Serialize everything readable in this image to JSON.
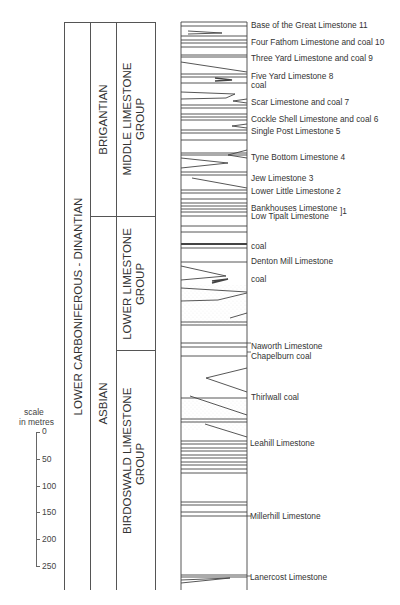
{
  "diagram": {
    "type": "stratigraphic-column",
    "columns": {
      "system": {
        "label": "LOWER CARBONIFEROUS - DINANTIAN"
      },
      "stages": [
        {
          "label": "BRIGANTIAN"
        },
        {
          "label": "ASBIAN"
        }
      ],
      "groups": [
        {
          "line1": "MIDDLE LIMESTONE",
          "line2": "GROUP"
        },
        {
          "line1": "LOWER LIMESTONE",
          "line2": "GROUP"
        },
        {
          "line1": "BIRDOSWALD LIMESTONE",
          "line2": "GROUP"
        }
      ]
    },
    "scale": {
      "title_line1": "scale",
      "title_line2": "in metres",
      "ticks": [
        "0",
        "50",
        "100",
        "150",
        "200",
        "250"
      ]
    },
    "units": [
      {
        "label": "Base of the Great Limestone  11",
        "y": 24
      },
      {
        "label": "Four Fathom Limestone and coal  10",
        "y": 38
      },
      {
        "label": "Three Yard Limestone and coal  9",
        "y": 54
      },
      {
        "label": "Five Yard Limestone  8",
        "y": 72
      },
      {
        "label": "coal",
        "y": 82
      },
      {
        "label": "Scar Limestone and coal  7",
        "y": 98
      },
      {
        "label": "Cockle Shell Limestone and coal  6",
        "y": 115
      },
      {
        "label": "Single Post Limestone  5",
        "y": 127
      },
      {
        "label": "Tyne Bottom Limestone  4",
        "y": 153
      },
      {
        "label": "Jew Limestone  3",
        "y": 174
      },
      {
        "label": "Lower Little Limestone  2",
        "y": 187
      },
      {
        "label": "Bankhouses Limestone",
        "y": 204
      },
      {
        "label": "Low Tipalt Limestone",
        "y": 212
      },
      {
        "label": "]1",
        "y": 207
      },
      {
        "label": "coal",
        "y": 243
      },
      {
        "label": "Denton Mill Limestone",
        "y": 257
      },
      {
        "label": "coal",
        "y": 276
      },
      {
        "label": "Naworth Limestone",
        "y": 342
      },
      {
        "label": "Chapelburn coal",
        "y": 352
      },
      {
        "label": "Thirlwall coal",
        "y": 393
      },
      {
        "label": "Leahill Limestone",
        "y": 440
      },
      {
        "label": "Millerhill Limestone",
        "y": 515
      },
      {
        "label": "Lanercost Limestone",
        "y": 576
      }
    ]
  }
}
